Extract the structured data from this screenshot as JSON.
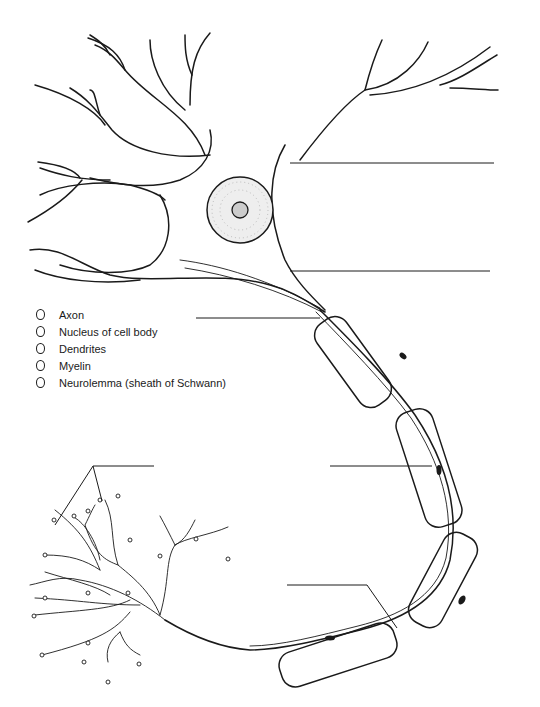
{
  "diagram": {
    "legend": {
      "items": [
        {
          "label": "Axon"
        },
        {
          "label": "Nucleus of cell body"
        },
        {
          "label": "Dendrites"
        },
        {
          "label": "Myelin"
        },
        {
          "label": "Neurolemma (sheath of Schwann)"
        }
      ]
    },
    "label_lines": [
      {
        "id": "line-1",
        "x1": 290,
        "y1": 163,
        "x2": 494,
        "y2": 163
      },
      {
        "id": "line-2",
        "x1": 290,
        "y1": 271,
        "x2": 490,
        "y2": 271
      },
      {
        "id": "line-3",
        "x1": 196,
        "y1": 318,
        "x2": 320,
        "y2": 318
      },
      {
        "id": "line-4",
        "x1": 330,
        "y1": 466,
        "x2": 430,
        "y2": 466
      },
      {
        "id": "line-5",
        "x1": 93,
        "y1": 466,
        "x2": 154,
        "y2": 466
      },
      {
        "id": "line-6",
        "x1": 287,
        "y1": 585,
        "x2": 372,
        "y2": 585
      }
    ],
    "colors": {
      "ink": "#1a1a1a",
      "background": "#ffffff"
    }
  }
}
